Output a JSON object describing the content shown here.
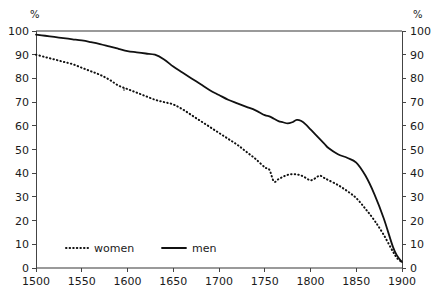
{
  "chart_data": {
    "type": "line",
    "title": "",
    "subtitle": "",
    "xlabel": "",
    "ylabel": "",
    "y_unit_label": "%",
    "y_unit_label_right": "%",
    "xlim": [
      1500,
      1900
    ],
    "ylim": [
      0,
      100
    ],
    "grid": false,
    "legend_position": "bottom-left-inside",
    "x_ticks": [
      1500,
      1550,
      1600,
      1650,
      1700,
      1750,
      1800,
      1850,
      1900
    ],
    "x_tick_labels": [
      "1500",
      "1550",
      "1600",
      "1650",
      "1700",
      "1750",
      "1800",
      "1850",
      "1900"
    ],
    "y_ticks": [
      0,
      10,
      20,
      30,
      40,
      50,
      60,
      70,
      80,
      90,
      100
    ],
    "y_tick_labels": [
      "0",
      "10",
      "20",
      "30",
      "40",
      "50",
      "60",
      "70",
      "80",
      "90",
      "100"
    ],
    "y_ticks_right": [
      0,
      10,
      20,
      30,
      40,
      50,
      60,
      70,
      80,
      90,
      100
    ],
    "y_tick_labels_right": [
      "0",
      "10",
      "20",
      "30",
      "40",
      "50",
      "60",
      "70",
      "80",
      "90",
      "100"
    ],
    "x": [
      1500,
      1510,
      1520,
      1530,
      1540,
      1550,
      1560,
      1570,
      1580,
      1590,
      1600,
      1610,
      1620,
      1630,
      1640,
      1650,
      1660,
      1670,
      1680,
      1690,
      1700,
      1710,
      1720,
      1730,
      1740,
      1750,
      1755,
      1760,
      1765,
      1770,
      1775,
      1780,
      1785,
      1790,
      1795,
      1800,
      1805,
      1810,
      1815,
      1820,
      1830,
      1840,
      1850,
      1860,
      1870,
      1880,
      1890,
      1895,
      1900
    ],
    "series": [
      {
        "name": "women",
        "style": "dotted",
        "values": [
          90.0,
          89.0,
          88.0,
          87.0,
          86.0,
          84.5,
          83.0,
          81.5,
          79.5,
          77.0,
          75.5,
          74.0,
          72.5,
          71.0,
          70.0,
          69.0,
          67.0,
          64.5,
          62.0,
          59.5,
          57.0,
          54.5,
          52.0,
          49.0,
          46.0,
          42.5,
          41.5,
          36.5,
          37.5,
          38.5,
          39.3,
          39.6,
          39.5,
          39.0,
          38.0,
          37.0,
          37.8,
          39.0,
          38.0,
          37.0,
          35.0,
          32.5,
          29.5,
          25.0,
          20.0,
          14.0,
          7.0,
          4.0,
          2.5
        ]
      },
      {
        "name": "men",
        "style": "solid",
        "values": [
          98.5,
          98.0,
          97.5,
          97.0,
          96.5,
          96.0,
          95.3,
          94.5,
          93.5,
          92.5,
          91.5,
          91.0,
          90.5,
          90.0,
          88.0,
          85.0,
          82.5,
          80.0,
          77.5,
          75.0,
          73.0,
          71.0,
          69.5,
          68.0,
          66.5,
          64.5,
          64.0,
          63.0,
          62.0,
          61.5,
          61.0,
          61.5,
          62.5,
          62.0,
          60.5,
          58.5,
          56.5,
          54.5,
          52.5,
          50.5,
          48.0,
          46.5,
          44.5,
          39.0,
          31.0,
          21.0,
          9.0,
          5.0,
          2.5
        ]
      }
    ]
  },
  "legend": {
    "items": [
      {
        "label": "women",
        "style": "dotted"
      },
      {
        "label": "men",
        "style": "solid"
      }
    ]
  },
  "colors": {
    "series": "#111111",
    "axis": "#444444",
    "frame": "#9a9a9a",
    "background": "#ffffff",
    "text": "#1a1a1a"
  }
}
